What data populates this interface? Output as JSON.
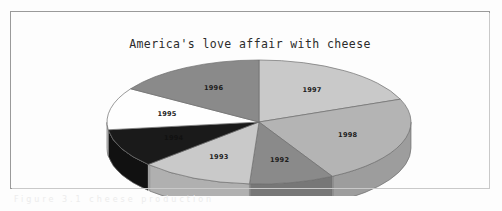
{
  "page": {
    "background_color": "#fdfdfd",
    "frame_border_color": "#9a9a9a",
    "scan_artifact_text": "Figure 3.1  cheese production"
  },
  "chart_data": {
    "type": "pie",
    "title": "America's love affair with cheese",
    "xlabel": "",
    "ylabel": "",
    "legend": "none",
    "three_d": true,
    "rotation_start_deg": -90,
    "categories": [
      "1997",
      "1998",
      "1992",
      "1993",
      "1994",
      "1995",
      "1996"
    ],
    "values": [
      19,
      23,
      9,
      12,
      10,
      11,
      16
    ],
    "labels_shown": [
      "1997",
      "1998",
      "1992",
      "1993",
      "1994",
      "1995",
      "1996"
    ],
    "colors": [
      "#c9c9c9",
      "#b4b4b4",
      "#8a8a8a",
      "#c9c9c9",
      "#1a1a1a",
      "#fefefe",
      "#8a8a8a"
    ],
    "slices": [
      {
        "label": "1997",
        "value": 19,
        "color": "#c9c9c9",
        "side_color": "#b0b0b0"
      },
      {
        "label": "1998",
        "value": 23,
        "color": "#b4b4b4",
        "side_color": "#9d9d9d"
      },
      {
        "label": "1992",
        "value": 9,
        "color": "#8a8a8a",
        "side_color": "#777777"
      },
      {
        "label": "1993",
        "value": 12,
        "color": "#c9c9c9",
        "side_color": "#b0b0b0"
      },
      {
        "label": "1994",
        "value": 10,
        "color": "#1a1a1a",
        "side_color": "#111111"
      },
      {
        "label": "1995",
        "value": 11,
        "color": "#fefefe",
        "side_color": "#e2e2e2"
      },
      {
        "label": "1996",
        "value": 16,
        "color": "#8a8a8a",
        "side_color": "#777777"
      }
    ]
  }
}
